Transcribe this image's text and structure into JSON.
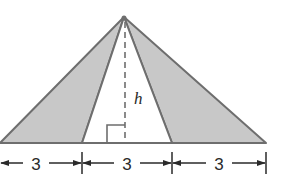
{
  "diagram": {
    "colors": {
      "fill_shaded": "#c8c8c8",
      "stroke": "#6e6e6e",
      "text": "#2a2a2a",
      "background": "#ffffff"
    },
    "apex": {
      "x": 124,
      "y": 17
    },
    "base_y": 143,
    "base_points_x": [
      0,
      82,
      172,
      266
    ],
    "height_label": "h",
    "segments": [
      {
        "label": "3",
        "from_x": 0,
        "to_x": 82
      },
      {
        "label": "3",
        "from_x": 82,
        "to_x": 172
      },
      {
        "label": "3",
        "from_x": 172,
        "to_x": 266
      }
    ],
    "shaded_regions": [
      "left-triangle",
      "right-triangle"
    ],
    "unshaded_regions": [
      "middle-triangle"
    ]
  }
}
